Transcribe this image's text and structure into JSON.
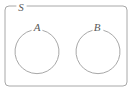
{
  "diagram": {
    "type": "venn",
    "background_color": "#ffffff",
    "stroke_color": "#a8a8a8",
    "label_color": "#5a5a5a",
    "universe": {
      "label": "S",
      "shape": "rounded-rectangle",
      "x": 5,
      "y": 6,
      "width": 122,
      "height": 80,
      "corner_radius": 4,
      "label_x": 21,
      "label_y": 11
    },
    "sets": [
      {
        "label": "A",
        "shape": "circle",
        "cx": 35,
        "cy": 52,
        "r": 22,
        "label_x": 37,
        "label_y": 31
      },
      {
        "label": "B",
        "shape": "circle",
        "cx": 96,
        "cy": 52,
        "r": 22,
        "label_x": 97,
        "label_y": 31
      }
    ],
    "relationship": "disjoint",
    "shaded_regions": []
  }
}
